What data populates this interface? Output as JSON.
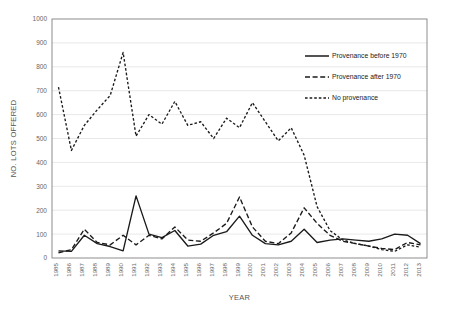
{
  "chart_data": {
    "type": "line",
    "title": "",
    "xlabel": "YEAR",
    "ylabel": "NO. LOTS OFFERED",
    "ylim": [
      0,
      1000
    ],
    "ytick_step": 100,
    "yticks": [
      0,
      100,
      200,
      300,
      400,
      500,
      600,
      700,
      800,
      900,
      1000
    ],
    "grid": true,
    "legend_position": "top-right-inside",
    "categories": [
      "1985",
      "1986",
      "1987",
      "1988",
      "1989",
      "1990",
      "1991",
      "1992",
      "1993",
      "1994",
      "1995",
      "1996",
      "1997",
      "1998",
      "1999",
      "2000",
      "2001",
      "2002",
      "2003",
      "2004",
      "2005",
      "2006",
      "2007",
      "2008",
      "2009",
      "2010",
      "2011",
      "2012",
      "2013"
    ],
    "series": [
      {
        "name": "Provenance before 1970",
        "style": "solid",
        "color": "#1a1a1a",
        "values": [
          30,
          28,
          95,
          60,
          48,
          30,
          260,
          100,
          85,
          115,
          50,
          58,
          95,
          110,
          175,
          95,
          60,
          55,
          70,
          120,
          65,
          75,
          80,
          75,
          70,
          80,
          100,
          95,
          60
        ]
      },
      {
        "name": "Provenance after 1970",
        "style": "dashed",
        "color": "#1a1a1a",
        "values": [
          22,
          35,
          120,
          65,
          55,
          95,
          55,
          95,
          80,
          130,
          75,
          70,
          105,
          145,
          255,
          130,
          70,
          60,
          105,
          210,
          145,
          95,
          70,
          60,
          50,
          40,
          35,
          65,
          55
        ]
      },
      {
        "name": "No provenance",
        "style": "dotted",
        "color": "#1a1a1a",
        "values": [
          715,
          450,
          555,
          620,
          680,
          860,
          510,
          600,
          560,
          655,
          555,
          570,
          500,
          585,
          545,
          650,
          570,
          490,
          545,
          430,
          215,
          115,
          75,
          60,
          50,
          35,
          28,
          55,
          45
        ]
      }
    ]
  },
  "legend": {
    "items": [
      {
        "label": "Provenance before 1970",
        "style": "solid"
      },
      {
        "label": "Provenance after 1970",
        "style": "dashed"
      },
      {
        "label": "No provenance",
        "style": "dotted"
      }
    ]
  }
}
